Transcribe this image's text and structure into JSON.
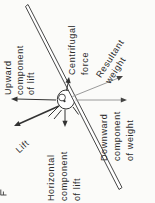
{
  "figure": {
    "type": "physics-force-diagram",
    "colors": {
      "background": "#fbfbf9",
      "ink": "#2f2f2f",
      "faint_line": "#9a9a9a"
    },
    "labels": {
      "upward_component": "Upward\ncomponent\nof lift",
      "lift": "Lift",
      "horizontal_component": "Horizontal\ncomponent\nof lift",
      "centrifugal_force": "Centrifugal\nforce",
      "downward_component": "Downward\ncomponent\nof weight",
      "resultant_weight": "Resultant\nweight"
    }
  }
}
